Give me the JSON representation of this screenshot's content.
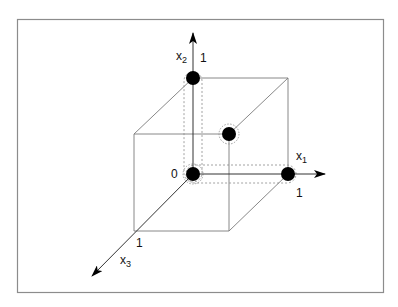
{
  "diagram": {
    "type": "unit-cube-vertices",
    "axes": [
      {
        "id": "x1",
        "name": "x",
        "subscript": "1",
        "tick": "1"
      },
      {
        "id": "x2",
        "name": "x",
        "subscript": "2",
        "tick": "1"
      },
      {
        "id": "x3",
        "name": "x",
        "subscript": "3",
        "tick": "1"
      }
    ],
    "origin_label": "0",
    "highlighted_points": [
      {
        "label": "origin",
        "coords": [
          0,
          0,
          0
        ]
      },
      {
        "label": "x1-unit",
        "coords": [
          1,
          0,
          0
        ]
      },
      {
        "label": "x2-unit",
        "coords": [
          0,
          1,
          0
        ]
      },
      {
        "label": "x3-unit",
        "coords": [
          0,
          0,
          1
        ]
      }
    ],
    "colors": {
      "frame": "#8c8c8c",
      "edge": "#7a7a7a",
      "dot": "#000000"
    }
  }
}
